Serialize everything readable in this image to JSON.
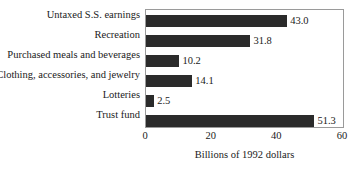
{
  "chart_data": {
    "type": "bar",
    "orientation": "horizontal",
    "title": "",
    "xlabel": "Billions of 1992 dollars",
    "ylabel": "",
    "xlim": [
      0,
      60
    ],
    "xticks": [
      "0",
      "20",
      "40",
      "60"
    ],
    "grid": false,
    "legend": null,
    "bar_color": "#2b2b2b",
    "frame_color": "#9a9a9a",
    "background": "#ffffff",
    "categories": [
      "Untaxed S.S. earnings",
      "Recreation",
      "Purchased meals and beverages",
      "Clothing, accessories, and jewelry",
      "Lotteries",
      "Trust fund"
    ],
    "values": [
      43.0,
      31.8,
      10.2,
      14.1,
      2.5,
      51.3
    ],
    "value_labels": [
      "43.0",
      "31.8",
      "10.2",
      "14.1",
      "2.5",
      "51.3"
    ]
  }
}
